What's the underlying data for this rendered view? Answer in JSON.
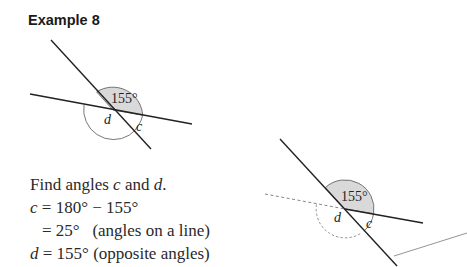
{
  "title": "Example 8",
  "figure_left": {
    "given_angle_label": "155°",
    "angle_labels": [
      "d",
      "c"
    ]
  },
  "figure_right": {
    "given_angle_label": "155°",
    "angle_labels": [
      "d",
      "c"
    ]
  },
  "solution": {
    "prompt_prefix": "Find angles ",
    "prompt_var1": "c",
    "prompt_mid": " and ",
    "prompt_var2": "d",
    "prompt_suffix": ".",
    "line1_var": "c",
    "line1_expr": " = 180° − 155°",
    "line2_expr": "= 25°   (angles on a line)",
    "line3_var": "d",
    "line3_expr": " = 155° (opposite angles)"
  }
}
